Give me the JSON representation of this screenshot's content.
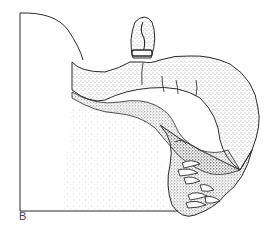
{
  "figure": {
    "panel_label": "B",
    "colors": {
      "ink": "#2a2a2a",
      "background": "#ffffff",
      "stipple": "#555555"
    }
  }
}
